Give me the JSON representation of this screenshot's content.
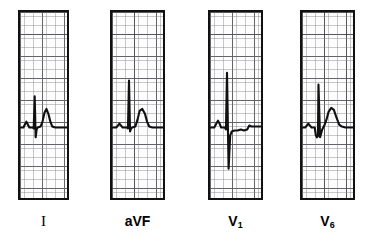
{
  "figure": {
    "background_color": "#ffffff",
    "trace_color": "#101010",
    "grid_minor_color": "#78787d",
    "grid_major_color": "#28282d",
    "border_color": "#111111"
  },
  "panels": [
    {
      "id": "lead-i",
      "label": "I",
      "label_style": "serif",
      "x": 18,
      "y": 10,
      "width": 51,
      "height": 190,
      "baseline_pct": 62,
      "description": "P wave, narrow tall R with small S, rounded T wave"
    },
    {
      "id": "lead-avf",
      "label": "aVF",
      "label_style": "sans",
      "x": 110,
      "y": 10,
      "width": 55,
      "height": 190,
      "baseline_pct": 62,
      "description": "Flat baseline, very narrow tall R spike, broad rounded T wave"
    },
    {
      "id": "lead-v1",
      "label": "V",
      "label_sub": "1",
      "label_style": "sans",
      "x": 208,
      "y": 10,
      "width": 55,
      "height": 190,
      "baseline_pct": 62,
      "description": "Tall narrow R wave with deep S wave, slightly depressed ST segment"
    },
    {
      "id": "lead-v6",
      "label": "V",
      "label_sub": "6",
      "label_style": "sans",
      "x": 300,
      "y": 10,
      "width": 55,
      "height": 190,
      "baseline_pct": 62,
      "description": "Small q wave, tall narrow R, small s, upsloping ST into broad T wave"
    }
  ],
  "chart_data": {
    "type": "line",
    "xlabel": "",
    "ylabel": "",
    "grid": true,
    "legend_position": "below-each-panel",
    "axis_note": "ECG graph paper: minor squares 1 mm, major squares 5 mm",
    "series": [
      {
        "name": "I",
        "points": "M0,118 L7,118 L10,115 L13,112 L16,115 L19,118 L26,118 L28,119 L30,86 L32,128 L34,120 L36,118 L42,117 L46,112 L50,103 L54,99 L58,104 L62,112 L66,117 L72,118 L96,118"
      },
      {
        "name": "aVF",
        "points": "M0,118 L8,118 L11,116 L14,114 L17,116 L20,118 L28,118 L30,119 L32,70 L34,122 L36,119 L38,118 L44,117 L48,110 L52,101 L57,99 L62,104 L66,112 L70,117 L76,118 L96,118"
      },
      {
        "name": "V1",
        "points": "M0,118 L8,118 L12,114 L15,111 L18,114 L21,118 L28,118 L30,120 L32,62 L35,160 L38,126 L41,122 L46,121 L52,121 L58,120 L64,121 L70,120 L74,116 L78,117 L84,117 L96,117"
      },
      {
        "name": "V6",
        "points": "M0,118 L6,118 L9,116 L12,114 L15,116 L18,118 L24,118 L26,126 L28,128 L30,127 L31,74 L34,128 L36,124 L38,120 L42,116 L46,110 L50,102 L55,98 L60,100 L65,108 L70,115 L75,117 L82,118 L96,118"
      }
    ]
  }
}
